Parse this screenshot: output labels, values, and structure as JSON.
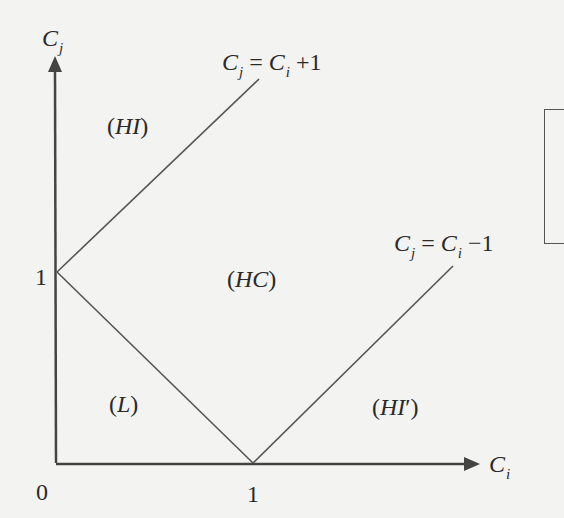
{
  "axes": {
    "y_label_main": "C",
    "y_label_sub": "j",
    "x_label_main": "C",
    "x_label_sub": "i",
    "origin_tick": "0",
    "x_tick_1": "1",
    "y_tick_1": "1"
  },
  "lines": {
    "upper": {
      "lhs_main": "C",
      "lhs_sub": "j",
      "eq": " = ",
      "rhs_main": "C",
      "rhs_sub": "i",
      "rhs_tail": " +1"
    },
    "lower": {
      "lhs_main": "C",
      "lhs_sub": "j",
      "eq": " = ",
      "rhs_main": "C",
      "rhs_sub": "i",
      "rhs_tail": " −1"
    }
  },
  "regions": {
    "hi": {
      "open": "(",
      "name": "HI",
      "close": ")"
    },
    "hc": {
      "open": "(",
      "name": "HC",
      "close": ")"
    },
    "l": {
      "open": "(",
      "name": "L",
      "close": ")"
    },
    "hi_prime": {
      "open": "(",
      "name": "HI",
      "prime": "′",
      "close": ")"
    }
  },
  "colors": {
    "line": "#555555",
    "axis": "#444444",
    "background": "#f3f3f1"
  }
}
